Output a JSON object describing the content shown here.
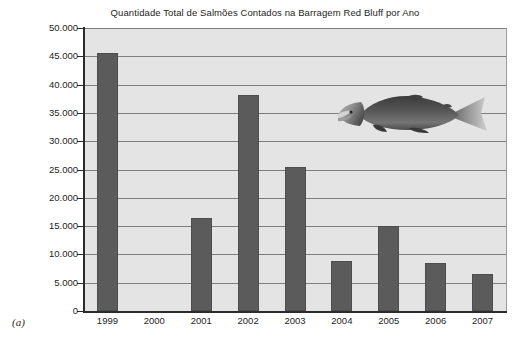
{
  "figure_letter": "(a)",
  "chart_data": {
    "type": "bar",
    "title": "Quantidade Total de Salmões Contados na Barragem Red Bluff por Ano",
    "xlabel": "",
    "ylabel": "",
    "categories": [
      "1999",
      "2000",
      "2001",
      "2002",
      "2003",
      "2004",
      "2005",
      "2006",
      "2007"
    ],
    "values": [
      45500,
      0,
      16500,
      38200,
      25400,
      8900,
      15000,
      8500,
      6600
    ],
    "ylim": [
      0,
      50000
    ],
    "ytick_values": [
      0,
      5000,
      10000,
      15000,
      20000,
      25000,
      30000,
      35000,
      40000,
      45000,
      50000
    ],
    "ytick_labels": [
      "0",
      "5.000",
      "10.000",
      "15.000",
      "20.000",
      "25.000",
      "30.000",
      "35.000",
      "40.000",
      "45.000",
      "50.000"
    ],
    "grid": true,
    "legend": false,
    "bar_color": "#5b5b5b",
    "plot_background": "#e4e4e4",
    "gridline_color": "#7e7e7e"
  },
  "decoration": {
    "salmon_label": "salmon-illustration"
  }
}
